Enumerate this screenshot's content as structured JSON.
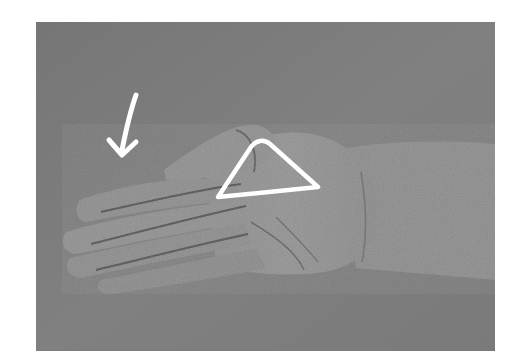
{
  "image": {
    "description": "Grayscale photograph of an open left hand, palm up, with the thumb tucked across; white annotation marks overlay the photo",
    "background_color": "#7c7c7c",
    "annotations": [
      {
        "type": "arrow",
        "icon": "arrow-down-left-icon",
        "color": "#ffffff",
        "meaning": "points toward the fingers"
      },
      {
        "type": "triangle-outline",
        "icon": "triangle-icon",
        "color": "#ffffff",
        "meaning": "highlights the area at the base of the thumb"
      }
    ]
  }
}
